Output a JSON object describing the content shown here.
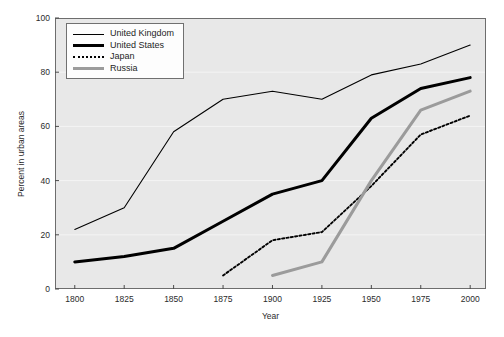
{
  "chart_data": {
    "type": "line",
    "title": "",
    "xlabel": "Year",
    "ylabel": "Percent in urban areas",
    "x": [
      1800,
      1825,
      1850,
      1875,
      1900,
      1925,
      1950,
      1975,
      2000
    ],
    "xlim": [
      1790,
      2008
    ],
    "ylim": [
      0,
      100
    ],
    "xticks": [
      "1800",
      "1825",
      "1850",
      "1875",
      "1900",
      "1925",
      "1950",
      "1975",
      "2000"
    ],
    "yticks": [
      "0",
      "20",
      "40",
      "60",
      "80",
      "100"
    ],
    "grid": "horizontal-faint",
    "legend_position": "upper-left-inside",
    "series": [
      {
        "name": "United Kingdom",
        "style": "thin-solid",
        "color": "#000000",
        "x": [
          1800,
          1825,
          1850,
          1875,
          1900,
          1925,
          1950,
          1975,
          2000
        ],
        "values": [
          22,
          30,
          58,
          70,
          73,
          70,
          79,
          83,
          90
        ]
      },
      {
        "name": "United States",
        "style": "thick-solid",
        "color": "#000000",
        "x": [
          1800,
          1825,
          1850,
          1875,
          1900,
          1925,
          1950,
          1975,
          2000
        ],
        "values": [
          10,
          12,
          15,
          25,
          35,
          40,
          63,
          74,
          78
        ]
      },
      {
        "name": "Japan",
        "style": "dotted",
        "color": "#000000",
        "x": [
          1875,
          1900,
          1925,
          1950,
          1975,
          2000
        ],
        "values": [
          5,
          18,
          21,
          38,
          57,
          64
        ]
      },
      {
        "name": "Russia",
        "style": "thick-solid-gray",
        "color": "#9b9b9b",
        "x": [
          1900,
          1925,
          1950,
          1975,
          2000
        ],
        "values": [
          5,
          10,
          40,
          66,
          73
        ]
      }
    ]
  },
  "legend": {
    "items": [
      {
        "label": "United Kingdom"
      },
      {
        "label": "United States"
      },
      {
        "label": "Japan"
      },
      {
        "label": "Russia"
      }
    ]
  },
  "caption": {
    "text": ""
  }
}
